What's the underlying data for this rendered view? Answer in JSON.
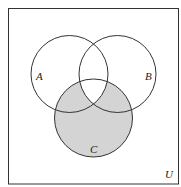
{
  "diagram": {
    "type": "venn",
    "universe_label": "U",
    "sets": [
      {
        "label": "A"
      },
      {
        "label": "B"
      },
      {
        "label": "C"
      }
    ],
    "shaded_region": "C minus (A ∩ B ∩ C)",
    "colors": {
      "shade": "#d4d4d4",
      "stroke": "#333333",
      "background": "#ffffff"
    }
  }
}
